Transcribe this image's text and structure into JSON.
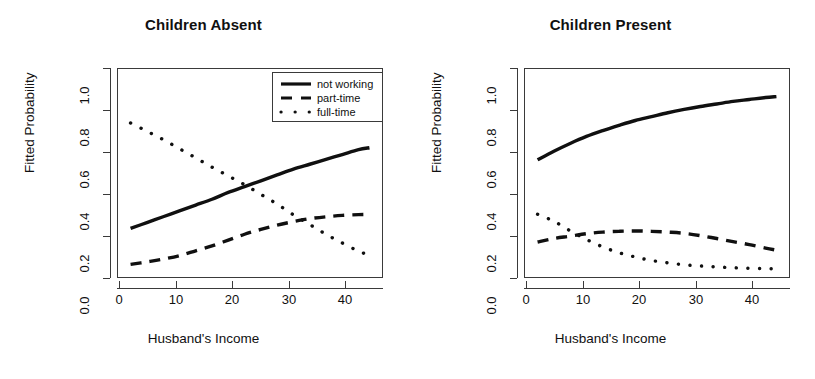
{
  "figure": {
    "width": 815,
    "height": 379,
    "background": "#ffffff",
    "line_color": "#101010"
  },
  "axis": {
    "x_title": "Husband's Income",
    "y_title": "Fitted Probability",
    "x_ticks": [
      "0",
      "10",
      "20",
      "30",
      "40"
    ],
    "x_tick_values": [
      0,
      10,
      20,
      30,
      40
    ],
    "y_ticks": [
      "0.0",
      "0.2",
      "0.4",
      "0.6",
      "0.8",
      "1.0"
    ],
    "y_tick_values": [
      0.0,
      0.2,
      0.4,
      0.6,
      0.8,
      1.0
    ],
    "xlim": [
      -1.5,
      47.5
    ],
    "ylim": [
      -0.04,
      1.04
    ]
  },
  "legend": {
    "position": "top-right",
    "entries": [
      {
        "label": "not working",
        "style": "solid"
      },
      {
        "label": "part-time",
        "style": "dashed"
      },
      {
        "label": "full-time",
        "style": "dotted"
      }
    ]
  },
  "panels": [
    {
      "title": "Children Absent",
      "has_legend": true
    },
    {
      "title": "Children Present",
      "has_legend": false
    }
  ],
  "chart_data": [
    {
      "type": "line",
      "title": "Children Absent",
      "xlabel": "Husband's Income",
      "ylabel": "Fitted Probability",
      "xlim": [
        -1.5,
        47.5
      ],
      "ylim": [
        -0.04,
        1.04
      ],
      "grid": false,
      "legend": "top-right",
      "x": [
        1,
        4,
        7,
        10,
        13,
        16,
        19,
        22,
        25,
        28,
        31,
        34,
        37,
        40,
        43,
        45
      ],
      "series": [
        {
          "name": "not working",
          "style": "solid",
          "values": [
            0.215,
            0.245,
            0.275,
            0.305,
            0.335,
            0.365,
            0.4,
            0.43,
            0.46,
            0.49,
            0.52,
            0.545,
            0.57,
            0.595,
            0.62,
            0.63
          ]
        },
        {
          "name": "part-time",
          "style": "dashed",
          "values": [
            0.03,
            0.043,
            0.057,
            0.075,
            0.1,
            0.125,
            0.155,
            0.185,
            0.21,
            0.232,
            0.25,
            0.265,
            0.275,
            0.282,
            0.286,
            0.287
          ]
        },
        {
          "name": "full-time",
          "style": "dotted",
          "values": [
            0.757,
            0.715,
            0.672,
            0.625,
            0.578,
            0.53,
            0.485,
            0.44,
            0.39,
            0.34,
            0.285,
            0.235,
            0.185,
            0.14,
            0.098,
            0.077
          ]
        }
      ]
    },
    {
      "type": "line",
      "title": "Children Present",
      "xlabel": "Husband's Income",
      "ylabel": "Fitted Probability",
      "xlim": [
        -1.5,
        47.5
      ],
      "ylim": [
        -0.04,
        1.04
      ],
      "grid": false,
      "legend": "none",
      "x": [
        1,
        4,
        7,
        10,
        13,
        16,
        19,
        22,
        25,
        28,
        31,
        34,
        37,
        40,
        43,
        45
      ],
      "series": [
        {
          "name": "not working",
          "style": "solid",
          "values": [
            0.568,
            0.612,
            0.652,
            0.688,
            0.718,
            0.745,
            0.77,
            0.79,
            0.81,
            0.827,
            0.842,
            0.855,
            0.868,
            0.878,
            0.888,
            0.893
          ]
        },
        {
          "name": "part-time",
          "style": "dashed",
          "values": [
            0.145,
            0.163,
            0.175,
            0.188,
            0.196,
            0.2,
            0.202,
            0.2,
            0.196,
            0.19,
            0.178,
            0.163,
            0.147,
            0.132,
            0.114,
            0.103
          ]
        },
        {
          "name": "full-time",
          "style": "dotted",
          "values": [
            0.288,
            0.252,
            0.203,
            0.158,
            0.12,
            0.09,
            0.068,
            0.05,
            0.038,
            0.028,
            0.022,
            0.017,
            0.013,
            0.01,
            0.008,
            0.007
          ]
        }
      ]
    }
  ]
}
